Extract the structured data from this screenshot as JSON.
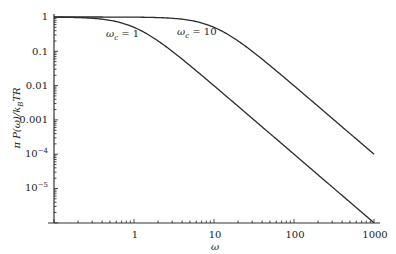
{
  "chart_data": {
    "type": "line",
    "title": "",
    "xlabel": "ω",
    "ylabel": "π P(ω)/k_B TR",
    "xscale": "log",
    "yscale": "log",
    "xlim": [
      0.1,
      1000
    ],
    "ylim": [
      1e-06,
      1
    ],
    "grid": false,
    "legend": "none (inline annotations)",
    "x_ticks": [
      "1",
      "10",
      "100",
      "1000"
    ],
    "y_ticks": [
      "1",
      "0.1",
      "0.01",
      "0.001",
      "10^-4",
      "10^-5"
    ],
    "series": [
      {
        "name": "ω_c = 1",
        "x": [
          0.1,
          0.3,
          0.5,
          1,
          2,
          5,
          10,
          30,
          100,
          300,
          1000
        ],
        "values": [
          0.99,
          0.917,
          0.8,
          0.5,
          0.2,
          0.0385,
          0.0099,
          0.0011,
          0.0001,
          1.1e-05,
          1e-06
        ]
      },
      {
        "name": "ω_c = 10",
        "x": [
          0.1,
          1,
          3,
          5,
          10,
          20,
          50,
          100,
          300,
          1000
        ],
        "values": [
          1.0,
          0.99,
          0.917,
          0.8,
          0.5,
          0.2,
          0.0385,
          0.0099,
          0.0011,
          0.0001
        ]
      }
    ],
    "annotations": [
      {
        "text": "ω_c = 1",
        "near": {
          "x": 0.5,
          "y": 0.5
        }
      },
      {
        "text": "ω_c = 10",
        "near": {
          "x": 5,
          "y": 0.5
        }
      }
    ]
  },
  "labels": {
    "ytick_1": "1",
    "ytick_01": "0.1",
    "ytick_001": "0.01",
    "ytick_0001": "0.001",
    "ytick_e4_base": "10",
    "ytick_e4_exp": "−4",
    "ytick_e5_base": "10",
    "ytick_e5_exp": "−5",
    "xtick_1": "1",
    "xtick_10": "10",
    "xtick_100": "100",
    "xtick_1000": "1000",
    "xlabel": "ω",
    "ylabel": "π P(ω)/k",
    "ylabel_sub": "B",
    "ylabel_tail": "TR",
    "ann1_main": "ω",
    "ann1_sub": "c",
    "ann1_tail": " = 1",
    "ann2_main": "ω",
    "ann2_sub": "c",
    "ann2_tail": " = 10"
  }
}
